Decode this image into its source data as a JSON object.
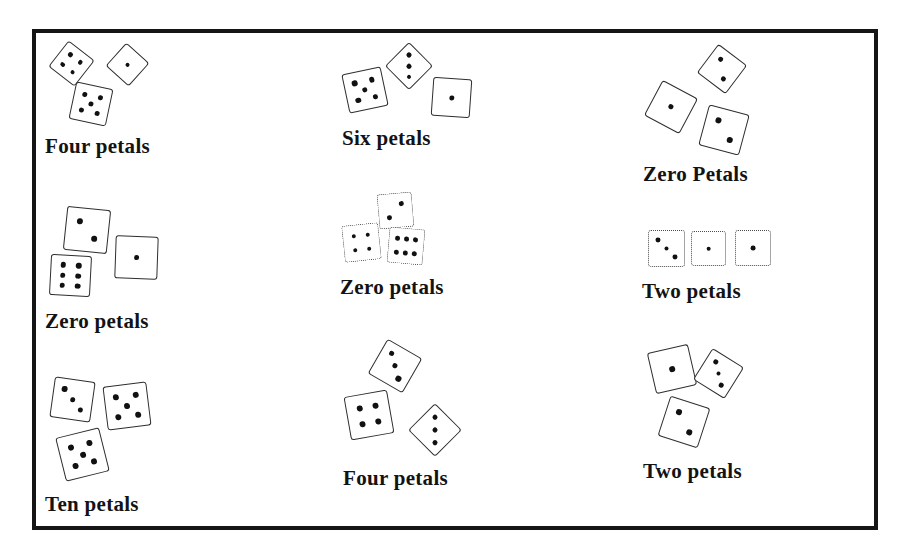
{
  "figure": {
    "colors": {
      "background": "#ffffff",
      "frame": "#151515",
      "die_edge": "#2e2e2e",
      "pip": "#111111",
      "label": "#131313"
    },
    "groups": [
      {
        "label": "Four petals",
        "label_x": 45,
        "label_y": 135,
        "dice": [
          {
            "value": 4,
            "x": 55,
            "y": 47,
            "size": 33,
            "rot": 38
          },
          {
            "value": 1,
            "x": 112,
            "y": 49,
            "size": 31,
            "rot": 42
          },
          {
            "value": 5,
            "x": 72,
            "y": 85,
            "size": 38,
            "rot": 12
          }
        ]
      },
      {
        "label": "Six petals",
        "label_x": 342,
        "label_y": 127,
        "dice": [
          {
            "value": 5,
            "x": 345,
            "y": 70,
            "size": 40,
            "rot": -12
          },
          {
            "value": 3,
            "x": 392,
            "y": 49,
            "size": 34,
            "rot": 45
          },
          {
            "value": 1,
            "x": 432,
            "y": 78,
            "size": 39,
            "rot": 4
          }
        ]
      },
      {
        "label": "Zero Petals",
        "label_x": 643,
        "label_y": 163,
        "dice": [
          {
            "value": 2,
            "x": 704,
            "y": 51,
            "size": 36,
            "rot": 37
          },
          {
            "value": 1,
            "x": 651,
            "y": 87,
            "size": 40,
            "rot": 28
          },
          {
            "value": 2,
            "x": 703,
            "y": 109,
            "size": 42,
            "rot": 15
          }
        ]
      },
      {
        "label": "Zero petals",
        "label_x": 45,
        "label_y": 310,
        "dice": [
          {
            "value": 2,
            "x": 65,
            "y": 208,
            "size": 44,
            "rot": 6
          },
          {
            "value": 6,
            "x": 50,
            "y": 255,
            "size": 41,
            "rot": 3
          },
          {
            "value": 1,
            "x": 115,
            "y": 236,
            "size": 43,
            "rot": 2
          }
        ]
      },
      {
        "label": "Zero petals",
        "label_x": 340,
        "label_y": 276,
        "dice": [
          {
            "value": 2,
            "x": 378,
            "y": 193,
            "size": 35,
            "rot": 85,
            "border": "dotted"
          },
          {
            "value": 4,
            "x": 343,
            "y": 224,
            "size": 37,
            "rot": -6,
            "border": "dotted"
          },
          {
            "value": 6,
            "x": 388,
            "y": 228,
            "size": 36,
            "rot": 95,
            "border": "dotted"
          }
        ]
      },
      {
        "label": "Two petals",
        "label_x": 642,
        "label_y": 280,
        "dice": [
          {
            "value": 3,
            "x": 648,
            "y": 230,
            "size": 37,
            "rot": 0,
            "border": "dotted"
          },
          {
            "value": 1,
            "x": 691,
            "y": 231,
            "size": 35,
            "rot": 0,
            "border": "dotted"
          },
          {
            "value": 1,
            "x": 735,
            "y": 230,
            "size": 36,
            "rot": 0,
            "border": "dotted"
          }
        ]
      },
      {
        "label": "Ten petals",
        "label_x": 45,
        "label_y": 493,
        "dice": [
          {
            "value": 3,
            "x": 52,
            "y": 379,
            "size": 41,
            "rot": 8
          },
          {
            "value": 5,
            "x": 105,
            "y": 384,
            "size": 44,
            "rot": -7
          },
          {
            "value": 5,
            "x": 60,
            "y": 432,
            "size": 45,
            "rot": -14
          }
        ]
      },
      {
        "label": "Four petals",
        "label_x": 343,
        "label_y": 467,
        "dice": [
          {
            "value": 3,
            "x": 375,
            "y": 346,
            "size": 40,
            "rot": 30
          },
          {
            "value": 4,
            "x": 347,
            "y": 393,
            "size": 44,
            "rot": -10
          },
          {
            "value": 3,
            "x": 416,
            "y": 411,
            "size": 38,
            "rot": 45
          }
        ]
      },
      {
        "label": "Two petals",
        "label_x": 643,
        "label_y": 460,
        "dice": [
          {
            "value": 1,
            "x": 651,
            "y": 348,
            "size": 42,
            "rot": -13
          },
          {
            "value": 3,
            "x": 700,
            "y": 355,
            "size": 37,
            "rot": 32
          },
          {
            "value": 2,
            "x": 663,
            "y": 401,
            "size": 42,
            "rot": 18
          }
        ]
      }
    ]
  }
}
